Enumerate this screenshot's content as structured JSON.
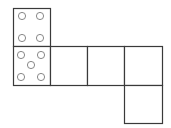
{
  "diagram": {
    "type": "cube-net",
    "colors": {
      "line": "#3a3a3a",
      "pip": "#7a7a7a",
      "background": "#ffffff"
    },
    "faces": [
      {
        "id": "face-top",
        "x": 13,
        "y": 8,
        "w": 37,
        "h": 38,
        "pips": 4
      },
      {
        "id": "face-left",
        "x": 13,
        "y": 46,
        "w": 37,
        "h": 39,
        "pips": 5
      },
      {
        "id": "face-front",
        "x": 50,
        "y": 46,
        "w": 37,
        "h": 39,
        "pips": 0
      },
      {
        "id": "face-right",
        "x": 87,
        "y": 46,
        "w": 37,
        "h": 39,
        "pips": 0
      },
      {
        "id": "face-back",
        "x": 124,
        "y": 46,
        "w": 38,
        "h": 39,
        "pips": 0
      },
      {
        "id": "face-bottom",
        "x": 124,
        "y": 85,
        "w": 38,
        "h": 38,
        "pips": 0
      }
    ],
    "pips": [
      {
        "face": "face-top",
        "cx": 22,
        "cy": 16,
        "r": 3.6
      },
      {
        "face": "face-top",
        "cx": 40,
        "cy": 16,
        "r": 3.6
      },
      {
        "face": "face-top",
        "cx": 22,
        "cy": 38,
        "r": 3.6
      },
      {
        "face": "face-top",
        "cx": 40,
        "cy": 38,
        "r": 3.6
      },
      {
        "face": "face-left",
        "cx": 21,
        "cy": 55,
        "r": 3.6
      },
      {
        "face": "face-left",
        "cx": 41,
        "cy": 55,
        "r": 3.6
      },
      {
        "face": "face-left",
        "cx": 31,
        "cy": 65,
        "r": 3.6
      },
      {
        "face": "face-left",
        "cx": 21,
        "cy": 77,
        "r": 3.6
      },
      {
        "face": "face-left",
        "cx": 41,
        "cy": 77,
        "r": 3.6
      }
    ]
  }
}
